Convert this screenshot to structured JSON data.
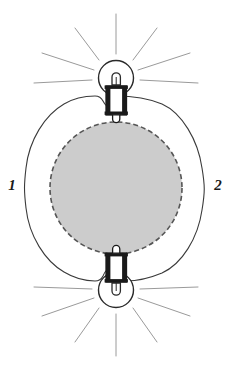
{
  "figure": {
    "type": "technical-diagram",
    "title": "",
    "background_color": "#ffffff",
    "width": 231,
    "height": 372
  },
  "labels": {
    "left": "1",
    "right": "2"
  },
  "colors": {
    "outline": "#3a3a3a",
    "shaded_region_fill": "#cccccc",
    "shaded_region_stroke": "#555555",
    "bulb_outline": "#2a2a2a",
    "socket_fill": "#1a1a1a",
    "ray_color": "#9a9a9a",
    "label_color": "#1a1a1a"
  },
  "elements": {
    "shaded_circle": {
      "name": "shaded-circle",
      "center_x": 116,
      "center_y": 188,
      "radius": 66,
      "border_style": "dashed",
      "fill": "#cccccc"
    },
    "outer_contour": {
      "name": "outer-contour",
      "center_x": 116,
      "center_y": 188,
      "radius_x": 90,
      "radius_y": 95,
      "notch_top": true,
      "notch_bottom": true
    },
    "bulb_top": {
      "name": "light-bulb-top",
      "orientation": "upright",
      "glass_center_x": 116,
      "glass_center_y": 78,
      "glass_radius": 17,
      "socket_x": 106,
      "socket_y": 88,
      "socket_width": 20,
      "socket_height": 28,
      "ray_count": 7
    },
    "bulb_bottom": {
      "name": "light-bulb-bottom",
      "orientation": "inverted",
      "glass_center_x": 116,
      "glass_center_y": 290,
      "glass_radius": 17,
      "socket_x": 106,
      "socket_y": 256,
      "socket_width": 20,
      "socket_height": 28,
      "ray_count": 7
    }
  },
  "rays": {
    "name": "light-rays",
    "angles_deg": [
      -90,
      -60,
      -30,
      0,
      30,
      60,
      90
    ],
    "inner_radius": 24,
    "outer_radius": 78,
    "color": "#9a9a9a",
    "stroke_width": 1
  }
}
